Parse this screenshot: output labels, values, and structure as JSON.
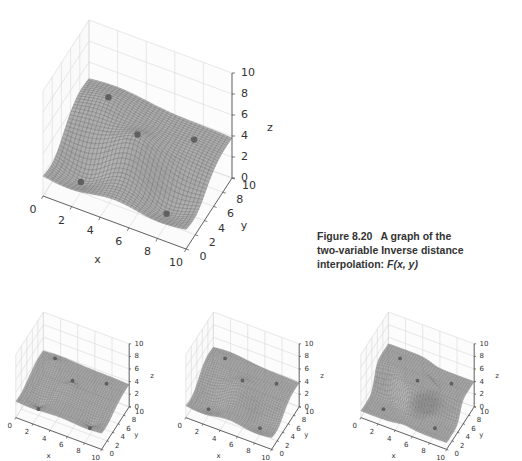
{
  "caption": {
    "figure_label": "Figure 8.20",
    "text_line1": "A graph of the",
    "text_line2": "two-variable Inverse distance",
    "text_line3_prefix": "interpolation: ",
    "text_line3_func": "F(x, y)"
  },
  "chart_data": [
    {
      "type": "surface3d",
      "title": "",
      "xlabel": "x",
      "ylabel": "y",
      "zlabel": "z",
      "xlim": [
        0,
        10
      ],
      "ylim": [
        0,
        10
      ],
      "zlim": [
        0,
        10
      ],
      "x_ticks": [
        "0",
        "2",
        "4",
        "6",
        "8",
        "10"
      ],
      "y_ticks": [
        "0",
        "2",
        "4",
        "6",
        "8",
        "10"
      ],
      "z_ticks": [
        "0",
        "2",
        "4",
        "6",
        "8",
        "10"
      ],
      "grid": true,
      "sample_points": [
        {
          "x": 2,
          "y": 2,
          "z": 1
        },
        {
          "x": 8,
          "y": 2,
          "z": 1
        },
        {
          "x": 2,
          "y": 8,
          "z": 5
        },
        {
          "x": 5,
          "y": 5,
          "z": 5
        },
        {
          "x": 8,
          "y": 8,
          "z": 4
        }
      ],
      "power": "medium",
      "position": "top"
    },
    {
      "type": "surface3d",
      "xlabel": "x",
      "ylabel": "y",
      "zlabel": "z",
      "xlim": [
        0,
        10
      ],
      "ylim": [
        0,
        10
      ],
      "zlim": [
        0,
        10
      ],
      "x_ticks": [
        "0",
        "2",
        "4",
        "6",
        "8",
        "10"
      ],
      "y_ticks": [
        "0",
        "2",
        "4",
        "6",
        "8",
        "10"
      ],
      "z_ticks": [
        "0",
        "2",
        "4",
        "6",
        "8",
        "10"
      ],
      "grid": true,
      "power": "low",
      "position": "bottom-left"
    },
    {
      "type": "surface3d",
      "xlabel": "x",
      "ylabel": "y",
      "zlabel": "z",
      "xlim": [
        0,
        10
      ],
      "ylim": [
        0,
        10
      ],
      "zlim": [
        0,
        10
      ],
      "x_ticks": [
        "0",
        "2",
        "4",
        "6",
        "8",
        "10"
      ],
      "y_ticks": [
        "0",
        "2",
        "4",
        "6",
        "8",
        "10"
      ],
      "z_ticks": [
        "0",
        "2",
        "4",
        "6",
        "8",
        "10"
      ],
      "grid": true,
      "power": "medium",
      "position": "bottom-center"
    },
    {
      "type": "surface3d",
      "xlabel": "x",
      "ylabel": "y",
      "zlabel": "z",
      "xlim": [
        0,
        10
      ],
      "ylim": [
        0,
        10
      ],
      "zlim": [
        0,
        10
      ],
      "x_ticks": [
        "0",
        "2",
        "4",
        "6",
        "8",
        "10"
      ],
      "y_ticks": [
        "0",
        "2",
        "4",
        "6",
        "8",
        "10"
      ],
      "z_ticks": [
        "0",
        "2",
        "4",
        "6",
        "8",
        "10"
      ],
      "grid": true,
      "power": "high",
      "position": "bottom-right"
    }
  ]
}
